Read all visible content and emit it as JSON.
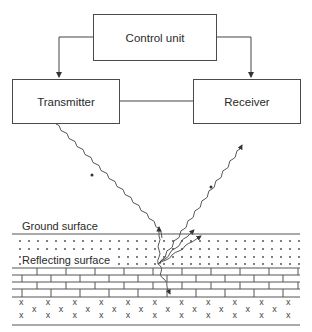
{
  "diagram": {
    "blocks": {
      "control": "Control unit",
      "transmitter": "Transmitter",
      "receiver": "Receiver"
    },
    "layers": {
      "ground": "Ground surface",
      "reflecting": "Reflecting surface"
    }
  }
}
